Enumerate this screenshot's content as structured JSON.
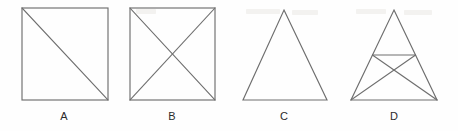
{
  "diagram": {
    "background_color": "#fefefe",
    "line_color": "#6e6e6e",
    "label_color": "#2b2b2b",
    "figures": [
      {
        "id": "A",
        "label": "A",
        "shape": "square",
        "description": "Square with one diagonal from top-left corner to bottom-right corner",
        "internal_lines": 1,
        "bounds": {
          "x": 22,
          "y": 8,
          "width": 86,
          "height": 92
        },
        "label_position": {
          "x": 52,
          "y": 110
        }
      },
      {
        "id": "B",
        "label": "B",
        "shape": "square",
        "description": "Square with both diagonals drawn, forming an X inside",
        "internal_lines": 2,
        "bounds": {
          "x": 130,
          "y": 8,
          "width": 85,
          "height": 92
        },
        "label_position": {
          "x": 160,
          "y": 110
        }
      },
      {
        "id": "C",
        "label": "C",
        "shape": "triangle",
        "description": "Plain isosceles triangle with no internal lines",
        "internal_lines": 0,
        "bounds": {
          "x": 243,
          "y": 10,
          "width": 84,
          "height": 90
        },
        "apex": {
          "x": 284,
          "y": 10
        },
        "label_position": {
          "x": 272,
          "y": 110
        }
      },
      {
        "id": "D",
        "label": "D",
        "shape": "triangle",
        "description": "Isosceles triangle with a horizontal midline joining the midpoints of the two slanted sides, plus two cevians from each base corner to the opposite side midpoint crossing in an X",
        "internal_lines": 3,
        "bounds": {
          "x": 351,
          "y": 10,
          "width": 86,
          "height": 90
        },
        "apex": {
          "x": 394,
          "y": 10
        },
        "label_position": {
          "x": 382,
          "y": 110
        }
      }
    ]
  }
}
